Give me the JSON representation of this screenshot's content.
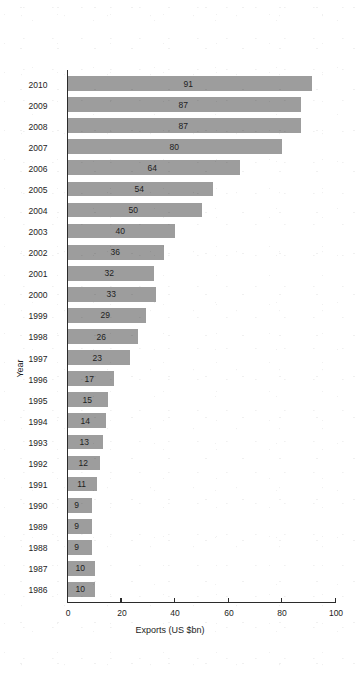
{
  "chart_data": {
    "type": "bar",
    "orientation": "horizontal",
    "title": "",
    "xlabel": "Exports (US $bn)",
    "ylabel": "Year",
    "xlim": [
      0,
      100
    ],
    "xticks": [
      0,
      20,
      40,
      60,
      80,
      100
    ],
    "xtick_labels": [
      "0",
      "20",
      "40",
      "60",
      "80",
      "100"
    ],
    "grid": false,
    "legend": null,
    "rotation_note": "figure rendered upside-down (180 degrees)",
    "bar_color": "#9d9d9d",
    "axis_color": "#2b2b2b",
    "background_color": "#ffffff",
    "categories": [
      "1986",
      "1987",
      "1988",
      "1989",
      "1990",
      "1991",
      "1992",
      "1993",
      "1994",
      "1995",
      "1996",
      "1997",
      "1998",
      "1999",
      "2000",
      "2001",
      "2002",
      "2003",
      "2004",
      "2005",
      "2006",
      "2007",
      "2008",
      "2009",
      "2010"
    ],
    "values": [
      10,
      10,
      9,
      9,
      9,
      11,
      12,
      13,
      14,
      15,
      17,
      23,
      26,
      29,
      33,
      32,
      36,
      40,
      50,
      54,
      64,
      80,
      87,
      87,
      91
    ],
    "data_labels": [
      "10",
      "10",
      "9",
      "9",
      "9",
      "11",
      "12",
      "13",
      "14",
      "15",
      "17",
      "23",
      "26",
      "29",
      "33",
      "32",
      "36",
      "40",
      "50",
      "54",
      "64",
      "80",
      "87",
      "87",
      "91"
    ]
  }
}
